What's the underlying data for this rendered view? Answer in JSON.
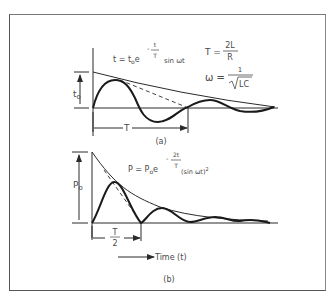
{
  "figure": {
    "panel_a": {
      "caption": "(a)",
      "equation_main": {
        "lhs": "t = t",
        "sub": "o",
        "e": "e",
        "exp_sign": "-",
        "exp_num": "t",
        "exp_den": "T",
        "tail": "sin ωt"
      },
      "equation_T": {
        "lhs": "T =",
        "num": "2L",
        "den": "R"
      },
      "equation_omega": {
        "lhs": "ω =",
        "num": "1",
        "den": "LC"
      },
      "amplitude_label": "t",
      "amplitude_sub": "o",
      "period_label": "T"
    },
    "panel_b": {
      "caption": "(b)",
      "equation_main": {
        "lhs": "P = P",
        "sub": "o",
        "e": "e",
        "exp_sign": "-",
        "exp_num": "2t",
        "exp_den": "T",
        "tail": "(sin ωt)",
        "sup": "2"
      },
      "amplitude_label": "P",
      "amplitude_sub": "o",
      "half_period_num": "T",
      "half_period_den": "2",
      "time_axis_label": "Time (t)"
    }
  },
  "colors": {
    "ink": "#2a2a2a",
    "text": "#4a4a4a",
    "background": "#ffffff"
  }
}
